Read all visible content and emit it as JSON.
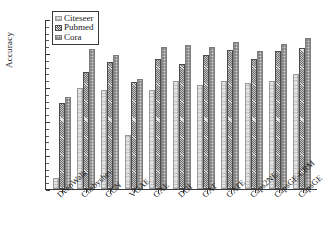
{
  "chart_data": {
    "type": "bar",
    "title": "",
    "xlabel": "",
    "ylabel": "Accuracy",
    "ylim": [
      0.4,
      0.9
    ],
    "ytick_labels": [
      "0.9",
      "0.8",
      "0.7",
      "0.6",
      "0.5",
      "0.4"
    ],
    "ytick_values": [
      0.9,
      0.8,
      0.7,
      0.6,
      0.5,
      0.4
    ],
    "grid": false,
    "legend_position": "top-left",
    "categories": [
      "DeepWalk",
      "Chebyshev",
      "GCN",
      "VGAE",
      "GAE",
      "DGI",
      "GAT",
      "GATE",
      "Caps2NE",
      "CapsGE-CRM",
      "CapsGE"
    ],
    "series": [
      {
        "name": "Citeseer",
        "color": "#e3e3e3",
        "values": [
          0.432,
          0.698,
          0.691,
          0.558,
          0.691,
          0.718,
          0.706,
          0.718,
          0.713,
          0.718,
          0.739
        ]
      },
      {
        "name": "Pubmed",
        "color": "#b9b9b9",
        "values": [
          0.653,
          0.745,
          0.773,
          0.716,
          0.781,
          0.768,
          0.795,
          0.809,
          0.783,
          0.806,
          0.816
        ]
      },
      {
        "name": "Cora",
        "color": "#d2d2d2",
        "values": [
          0.672,
          0.812,
          0.795,
          0.723,
          0.818,
          0.823,
          0.818,
          0.832,
          0.805,
          0.827,
          0.843
        ]
      }
    ]
  }
}
